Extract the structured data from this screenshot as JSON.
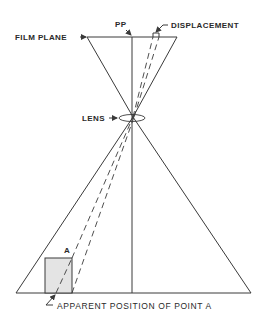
{
  "diagram": {
    "labels": {
      "film_plane": "FILM PLANE",
      "pp": "PP",
      "displacement": "DISPLACEMENT",
      "lens": "LENS",
      "point_a": "A",
      "apparent_position": "APPARENT POSITION OF POINT A"
    },
    "colors": {
      "line": "#3a3a3a",
      "object_fill": "#e4e4e4",
      "background": "#ffffff"
    }
  }
}
